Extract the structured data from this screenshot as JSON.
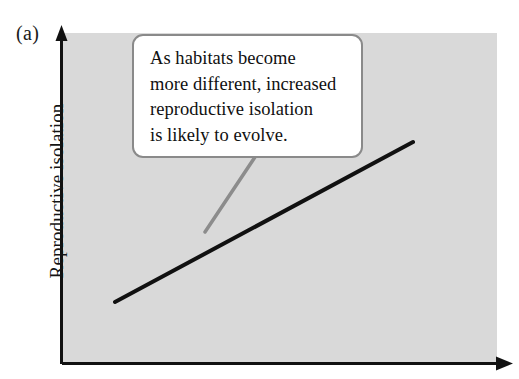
{
  "figure": {
    "panel_label": "(a)",
    "y_axis_label": "Reproductive isolation",
    "x_axis_label": "",
    "callout_text": "As habitats become\nmore different, increased\nreproductive isolation\nis likely to evolve.",
    "colors": {
      "plot_background": "#d9d9d9",
      "axis": "#111111",
      "trend_line": "#111111",
      "callout_border": "#8a8a8a",
      "callout_fill": "#ffffff",
      "leader_line": "#8c8c8c",
      "page_background": "#ffffff",
      "text": "#101010"
    }
  },
  "chart_data": {
    "type": "line",
    "title": "",
    "xlabel": "",
    "ylabel": "Reproductive isolation",
    "grid": false,
    "legend": null,
    "axes": {
      "x_axis": {
        "x_start": 62,
        "x_end": 512,
        "y": 364,
        "arrow": "right",
        "ticks": [],
        "tick_labels": []
      },
      "y_axis": {
        "y_start": 364,
        "y_end": 28,
        "x": 61,
        "arrow": "up",
        "ticks": [],
        "tick_labels": []
      }
    },
    "plot_area": {
      "x": 62,
      "y": 33,
      "width": 435,
      "height": 330
    },
    "series": [
      {
        "name": "Reproductive isolation vs habitat difference",
        "type": "line",
        "points": [
          [
            115,
            302
          ],
          [
            413,
            142
          ]
        ],
        "color": "#111111",
        "width": 4,
        "description": "Positive linear trend rising left to right"
      }
    ],
    "annotations": [
      {
        "kind": "callout",
        "text": "As habitats become more different, increased reproductive isolation is likely to evolve.",
        "box": {
          "x": 132,
          "y": 34,
          "width": 231,
          "height": 124
        },
        "leader": {
          "from": [
            255,
            157
          ],
          "to": [
            205,
            232
          ]
        }
      }
    ]
  }
}
